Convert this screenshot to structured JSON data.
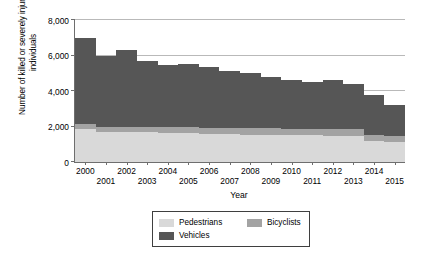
{
  "chart_data": {
    "type": "bar",
    "stacked": true,
    "title": "",
    "xlabel": "Year",
    "ylabel": "Number of killed or severely injured individuals",
    "categories": [
      "2000",
      "2001",
      "2002",
      "2003",
      "2004",
      "2005",
      "2006",
      "2007",
      "2008",
      "2009",
      "2010",
      "2011",
      "2012",
      "2013",
      "2014",
      "2015"
    ],
    "series": [
      {
        "name": "Pedestrians",
        "color": "#d9d9d9",
        "values": [
          1850,
          1700,
          1700,
          1700,
          1650,
          1650,
          1600,
          1600,
          1550,
          1550,
          1500,
          1500,
          1450,
          1450,
          1200,
          1150
        ]
      },
      {
        "name": "Bicyclists",
        "color": "#a3a3a3",
        "values": [
          300,
          300,
          300,
          300,
          300,
          300,
          300,
          300,
          350,
          350,
          350,
          350,
          400,
          400,
          350,
          300
        ]
      },
      {
        "name": "Vehicles",
        "color": "#565656",
        "values": [
          4850,
          4000,
          4300,
          3700,
          3500,
          3550,
          3450,
          3250,
          3100,
          2900,
          2750,
          2650,
          2750,
          2550,
          2250,
          1750
        ]
      }
    ],
    "totals": [
      7000,
      6000,
      6300,
      5700,
      5450,
      5500,
      5350,
      5150,
      5000,
      4800,
      4600,
      4500,
      4600,
      4400,
      3800,
      3200
    ],
    "ylim": [
      0,
      8000
    ],
    "yticks": [
      0,
      2000,
      4000,
      6000,
      8000
    ],
    "ytick_labels": [
      "0",
      "2,000",
      "4,000",
      "6,000",
      "8,000"
    ],
    "grid": true,
    "legend_position": "bottom",
    "legend_entries": [
      {
        "label": "Pedestrians",
        "color": "#d9d9d9"
      },
      {
        "label": "Bicyclists",
        "color": "#a3a3a3"
      },
      {
        "label": "Vehicles",
        "color": "#565656"
      }
    ]
  }
}
